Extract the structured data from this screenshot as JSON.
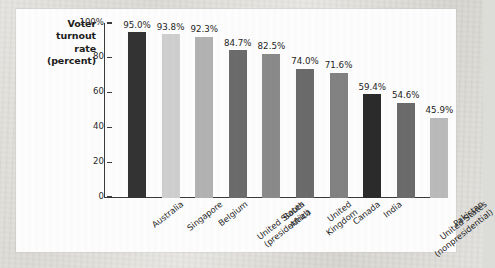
{
  "figure": {
    "axis_title_lines": [
      "Voter",
      "turnout",
      "rate",
      "(percent)"
    ]
  },
  "chart_data": {
    "type": "bar",
    "title": "",
    "xlabel": "",
    "ylabel": "Voter turnout rate (percent)",
    "ylim": [
      0,
      100
    ],
    "grid": false,
    "legend": "none",
    "ytick_labels": [
      "100%",
      "80",
      "60",
      "40",
      "20",
      "0"
    ],
    "ytick_values": [
      100,
      80,
      60,
      40,
      20,
      0
    ],
    "categories": [
      "Australia",
      "Singapore",
      "Belgium",
      "United States (presidential)",
      "South Africa",
      "United Kingdom",
      "Canada",
      "India",
      "United States (nonpresidential)",
      "Pakistan"
    ],
    "category_label_lines": [
      [
        "Australia"
      ],
      [
        "Singapore"
      ],
      [
        "Belgium"
      ],
      [
        "United States",
        "(presidential)"
      ],
      [
        "South",
        "Africa"
      ],
      [
        "United",
        "Kingdom"
      ],
      [
        "Canada"
      ],
      [
        "India"
      ],
      [
        "United States",
        "(nonpresidential)"
      ],
      [
        "Pakistan"
      ]
    ],
    "values": [
      95.0,
      93.8,
      92.3,
      84.7,
      82.5,
      74.0,
      71.6,
      59.4,
      54.6,
      45.9
    ],
    "value_labels": [
      "95.0%",
      "93.8%",
      "92.3%",
      "84.7%",
      "82.5%",
      "74.0%",
      "71.6%",
      "59.4%",
      "54.6%",
      "45.9%"
    ],
    "bar_colors": [
      "#333333",
      "#cfcfcf",
      "#b2b2b2",
      "#6b6b6b",
      "#8a8a8a",
      "#6b6b6b",
      "#828282",
      "#2b2b2b",
      "#6b6b6b",
      "#bababa"
    ]
  }
}
